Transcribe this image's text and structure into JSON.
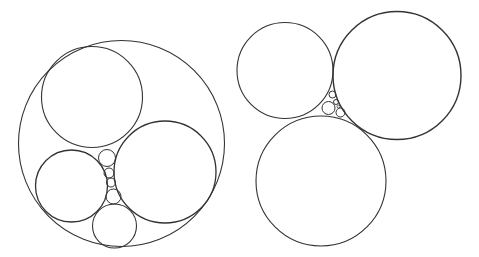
{
  "diagram": {
    "type": "circle-packing",
    "stroke_color": "#333333",
    "background": "#ffffff",
    "figures": [
      {
        "name": "enclosed-packing",
        "circles": [
          {
            "role": "outer",
            "cx": 121.5,
            "cy": 143.5,
            "r": 103,
            "w": 1.1
          },
          {
            "role": "top-left",
            "cx": 92,
            "cy": 97,
            "r": 50.5,
            "w": 1.1
          },
          {
            "role": "right",
            "cx": 165,
            "cy": 172,
            "r": 51,
            "w": 1.3
          },
          {
            "role": "bottom-left",
            "cx": 71.5,
            "cy": 186,
            "r": 36,
            "w": 1.3
          },
          {
            "role": "bottom",
            "cx": 114.5,
            "cy": 226,
            "r": 22,
            "w": 1.1
          },
          {
            "role": "chain-1",
            "cx": 107,
            "cy": 158,
            "r": 8.5,
            "w": 1
          },
          {
            "role": "chain-2",
            "cx": 109,
            "cy": 173,
            "r": 5,
            "w": 1
          },
          {
            "role": "chain-3",
            "cx": 111,
            "cy": 182.5,
            "r": 4.5,
            "w": 1
          },
          {
            "role": "chain-4",
            "cx": 113.5,
            "cy": 196.5,
            "r": 7.5,
            "w": 1
          }
        ]
      },
      {
        "name": "open-triple-packing",
        "circles": [
          {
            "role": "top-left",
            "cx": 285,
            "cy": 70.5,
            "r": 48,
            "w": 1.1
          },
          {
            "role": "top-right",
            "cx": 397,
            "cy": 75.5,
            "r": 64,
            "w": 1.4
          },
          {
            "role": "bottom",
            "cx": 321,
            "cy": 181,
            "r": 65,
            "w": 1.1
          },
          {
            "role": "gap-large",
            "cx": 328.5,
            "cy": 108,
            "r": 6.5,
            "w": 1
          },
          {
            "role": "gap-top",
            "cx": 332.5,
            "cy": 94.5,
            "r": 3.5,
            "w": 1
          },
          {
            "role": "gap-mid",
            "cx": 336,
            "cy": 102,
            "r": 2.5,
            "w": 1
          },
          {
            "role": "gap-lower-right",
            "cx": 340.5,
            "cy": 112.5,
            "r": 4.5,
            "w": 1
          },
          {
            "role": "gap-tiny",
            "cx": 338.5,
            "cy": 106.5,
            "r": 1.5,
            "w": 0.8
          }
        ]
      }
    ]
  }
}
